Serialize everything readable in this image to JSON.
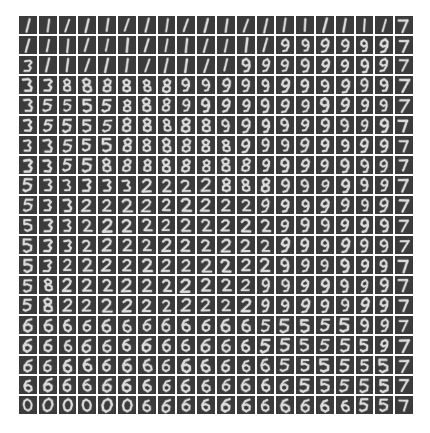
{
  "figure": {
    "type": "image-grid",
    "title": "",
    "background_color": "#ffffff",
    "tile_background_color": "#3b3b3b",
    "stroke_color": "#dcdcdc",
    "grid_rows": 20,
    "grid_cols": 20,
    "tile_size_px": 18,
    "tile_gap_px": 2,
    "grid_left_px": 19,
    "grid_top_px": 16,
    "grid_width_px": 394,
    "grid_height_px": 398,
    "total_tiles": 400,
    "axis_labels_visible": false,
    "tick_labels_visible": false,
    "legend_visible": false
  },
  "chart_data": {
    "type": "heatmap",
    "title": "",
    "xlabel": "",
    "ylabel": "",
    "grid": false,
    "legend_position": "none",
    "rows": 20,
    "cols": 20,
    "digit_labels": [
      [
        "1",
        "1",
        "1",
        "1",
        "1",
        "1",
        "1",
        "1",
        "1",
        "1",
        "1",
        "1",
        "1",
        "1",
        "1",
        "1",
        "1",
        "1",
        "1",
        "7"
      ],
      [
        "1",
        "1",
        "1",
        "1",
        "1",
        "1",
        "1",
        "1",
        "1",
        "1",
        "1",
        "1",
        "1",
        "9",
        "9",
        "9",
        "9",
        "9",
        "9",
        "7"
      ],
      [
        "3",
        "1",
        "1",
        "1",
        "1",
        "1",
        "1",
        "1",
        "1",
        "1",
        "1",
        "9",
        "9",
        "9",
        "9",
        "9",
        "9",
        "9",
        "9",
        "7"
      ],
      [
        "3",
        "3",
        "8",
        "8",
        "8",
        "8",
        "8",
        "8",
        "9",
        "9",
        "9",
        "9",
        "9",
        "9",
        "9",
        "9",
        "9",
        "9",
        "9",
        "7"
      ],
      [
        "3",
        "5",
        "5",
        "5",
        "5",
        "8",
        "8",
        "8",
        "9",
        "9",
        "9",
        "9",
        "9",
        "9",
        "9",
        "9",
        "9",
        "9",
        "9",
        "7"
      ],
      [
        "3",
        "5",
        "5",
        "5",
        "5",
        "8",
        "8",
        "8",
        "8",
        "8",
        "9",
        "9",
        "9",
        "9",
        "9",
        "9",
        "9",
        "9",
        "9",
        "7"
      ],
      [
        "3",
        "3",
        "5",
        "5",
        "5",
        "8",
        "8",
        "8",
        "8",
        "8",
        "8",
        "9",
        "9",
        "9",
        "9",
        "9",
        "9",
        "9",
        "9",
        "7"
      ],
      [
        "3",
        "3",
        "5",
        "5",
        "8",
        "8",
        "8",
        "8",
        "8",
        "8",
        "8",
        "8",
        "9",
        "9",
        "9",
        "9",
        "9",
        "9",
        "9",
        "7"
      ],
      [
        "5",
        "3",
        "3",
        "3",
        "3",
        "3",
        "2",
        "2",
        "2",
        "2",
        "8",
        "8",
        "8",
        "9",
        "9",
        "9",
        "9",
        "9",
        "9",
        "7"
      ],
      [
        "5",
        "3",
        "3",
        "2",
        "2",
        "2",
        "2",
        "2",
        "2",
        "2",
        "2",
        "2",
        "9",
        "9",
        "9",
        "9",
        "9",
        "9",
        "9",
        "7"
      ],
      [
        "5",
        "3",
        "3",
        "2",
        "2",
        "2",
        "2",
        "2",
        "2",
        "2",
        "2",
        "2",
        "2",
        "9",
        "9",
        "9",
        "9",
        "9",
        "9",
        "7"
      ],
      [
        "5",
        "3",
        "3",
        "2",
        "2",
        "2",
        "2",
        "2",
        "2",
        "2",
        "2",
        "2",
        "2",
        "9",
        "9",
        "9",
        "9",
        "9",
        "9",
        "7"
      ],
      [
        "5",
        "3",
        "2",
        "2",
        "2",
        "2",
        "2",
        "2",
        "2",
        "2",
        "2",
        "2",
        "2",
        "9",
        "9",
        "9",
        "9",
        "9",
        "9",
        "7"
      ],
      [
        "5",
        "8",
        "2",
        "2",
        "2",
        "2",
        "2",
        "2",
        "2",
        "2",
        "2",
        "2",
        "9",
        "9",
        "9",
        "9",
        "9",
        "9",
        "9",
        "7"
      ],
      [
        "5",
        "8",
        "2",
        "2",
        "2",
        "2",
        "2",
        "2",
        "2",
        "2",
        "2",
        "2",
        "9",
        "9",
        "9",
        "9",
        "9",
        "9",
        "9",
        "7"
      ],
      [
        "6",
        "6",
        "6",
        "6",
        "6",
        "6",
        "6",
        "6",
        "6",
        "6",
        "6",
        "6",
        "5",
        "5",
        "5",
        "5",
        "5",
        "9",
        "9",
        "7"
      ],
      [
        "6",
        "6",
        "6",
        "6",
        "6",
        "6",
        "6",
        "6",
        "6",
        "6",
        "6",
        "6",
        "5",
        "5",
        "5",
        "5",
        "5",
        "5",
        "9",
        "7"
      ],
      [
        "6",
        "6",
        "6",
        "6",
        "6",
        "6",
        "6",
        "6",
        "6",
        "6",
        "6",
        "6",
        "6",
        "5",
        "5",
        "5",
        "5",
        "5",
        "5",
        "7"
      ],
      [
        "6",
        "6",
        "6",
        "6",
        "6",
        "6",
        "6",
        "6",
        "6",
        "6",
        "6",
        "6",
        "6",
        "6",
        "5",
        "5",
        "5",
        "5",
        "5",
        "7"
      ],
      [
        "0",
        "0",
        "0",
        "0",
        "0",
        "0",
        "6",
        "6",
        "6",
        "6",
        "6",
        "6",
        "6",
        "6",
        "6",
        "6",
        "6",
        "5",
        "5",
        "7"
      ]
    ],
    "row_index_range": [
      0,
      19
    ],
    "col_index_range": [
      0,
      19
    ]
  }
}
